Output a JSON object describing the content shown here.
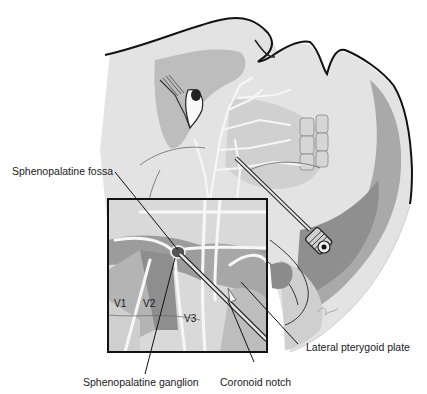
{
  "figure": {
    "colors": {
      "background": "#ffffff",
      "skin_light": "#e4e4e4",
      "skin_mid": "#c8c8c8",
      "skin_dark": "#a6a6a6",
      "deep_dark": "#8a8a8a",
      "nerve": "#f4f4f4",
      "outline": "#111111"
    }
  },
  "labels": {
    "sphenopalatine_fossa": "Sphenopalatine fossa",
    "sphenopalatine_ganglion": "Sphenopalatine ganglion",
    "coronoid_notch": "Coronoid notch",
    "lateral_pterygoid_plate": "Lateral pterygoid plate"
  },
  "inset_labels": {
    "v1": "V1",
    "v2": "V2",
    "v3": "V3"
  }
}
